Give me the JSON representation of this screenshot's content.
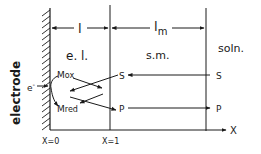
{
  "diagram": {
    "electrode_label": "electrode",
    "electron_label": "e",
    "electron_sup": "-",
    "regions": {
      "electrolyte_layer": "e. l.",
      "semipermeable_membrane": "s.m.",
      "solution": "soln."
    },
    "thickness_labels": {
      "layer": "l",
      "membrane_main": "l",
      "membrane_sub": "m"
    },
    "species": {
      "mox_main": "M",
      "mox_sub": "ox",
      "mred_main": "M",
      "mred_sub": "red",
      "substrate_inner": "S",
      "product_inner": "P",
      "substrate_outer": "S",
      "product_outer": "P"
    },
    "axis": {
      "label": "X",
      "tick_0": "X=0",
      "tick_1": "X=1"
    },
    "colors": {
      "ink": "#1a1a1a",
      "background": "#ffffff"
    }
  }
}
